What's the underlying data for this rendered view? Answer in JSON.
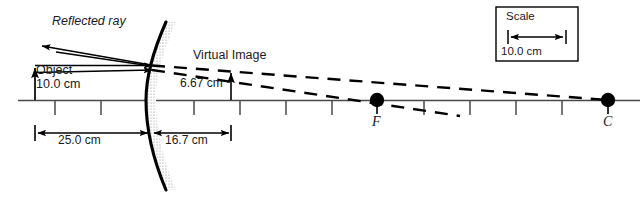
{
  "diagram": {
    "colors": {
      "ink": "#000000",
      "text": "#1a1a1a",
      "axis": "#4d4d4d",
      "mirror_back_stipple": "#9a9a9a",
      "background": "#ffffff"
    },
    "labels": {
      "reflected_ray": "Reflected ray",
      "object": "Object",
      "object_height": "10.0 cm",
      "virtual_image": "Virtual Image",
      "image_height": "6.67 cm",
      "object_distance": "25.0 cm",
      "image_distance": "16.7 cm",
      "focal_point": "F",
      "center_of_curvature": "C"
    },
    "scale_box": {
      "title": "Scale",
      "value": "10.0 cm"
    },
    "optics_values": {
      "object_height_cm": 10.0,
      "image_height_cm": 6.67,
      "object_distance_cm": 25.0,
      "image_distance_cm": 16.7,
      "ruler_tick_interval_cm": 5.0,
      "scale_bar_cm": 10.0,
      "mirror_type": "convex",
      "image_type": "virtual, upright, reduced"
    },
    "icons": {
      "object_arrow": "up-arrow-icon",
      "image_arrow": "up-arrow-icon",
      "reflected_ray_arrow": "arrow-head-icon",
      "incident_ray_arrow": "arrow-head-icon",
      "dimension_arrow": "double-arrow-icon",
      "focal_point_marker": "filled-circle-icon",
      "center_marker": "filled-circle-icon",
      "mirror": "convex-mirror-icon"
    }
  }
}
